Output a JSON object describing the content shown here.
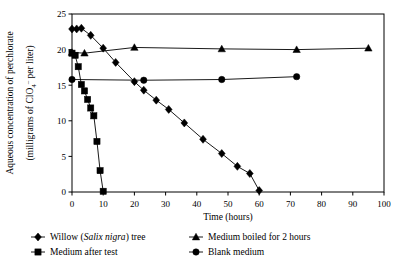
{
  "chart_data": {
    "type": "line",
    "title": "",
    "xlabel": "Time (hours)",
    "ylabel_line1": "Aqueous concentration of perchlorate",
    "ylabel_line2_prefix": "(milligrams of ClO",
    "ylabel_line2_sub": "4",
    "ylabel_line2_sup": "–",
    "ylabel_line2_suffix": " per liter)",
    "xlim": [
      0,
      100
    ],
    "ylim": [
      0,
      25
    ],
    "xticks": [
      0,
      10,
      20,
      30,
      40,
      50,
      60,
      70,
      80,
      90,
      100
    ],
    "yticks": [
      0,
      5,
      10,
      15,
      20,
      25
    ],
    "xtick_labels": [
      "0",
      "10",
      "20",
      "30",
      "40",
      "50",
      "60",
      "70",
      "80",
      "90",
      "100"
    ],
    "ytick_labels": [
      "0",
      "5",
      "10",
      "15",
      "20",
      "25"
    ],
    "grid": false,
    "legend_position": "below",
    "frame": "box",
    "series": [
      {
        "name": "Willow (Salix nigra) tree",
        "marker": "diamond",
        "color": "#000000",
        "x": [
          0,
          1.5,
          3,
          6,
          10,
          14,
          20,
          23,
          27,
          31,
          36,
          42,
          48,
          53,
          57,
          60
        ],
        "y": [
          22.9,
          22.9,
          23.0,
          22.0,
          20.2,
          18.2,
          15.5,
          14.3,
          12.9,
          11.6,
          9.7,
          7.4,
          5.4,
          3.6,
          2.6,
          0.2
        ]
      },
      {
        "name": "Medium boiled for 2 hours",
        "marker": "triangle",
        "color": "#000000",
        "x": [
          0,
          4,
          20,
          48,
          72,
          95
        ],
        "y": [
          19.6,
          19.5,
          20.3,
          20.1,
          20.0,
          20.2
        ]
      },
      {
        "name": "Medium after test",
        "marker": "square",
        "color": "#000000",
        "x": [
          0,
          1,
          2,
          3,
          4,
          5,
          6,
          7,
          8,
          9,
          10
        ],
        "y": [
          19.5,
          19.2,
          17.6,
          15.1,
          14.2,
          13.0,
          11.8,
          10.7,
          7.1,
          3.0,
          0.1
        ]
      },
      {
        "name": "Blank medium",
        "marker": "circle",
        "color": "#000000",
        "x": [
          0,
          23,
          48,
          72
        ],
        "y": [
          15.8,
          15.7,
          15.8,
          16.2
        ]
      }
    ],
    "legend": [
      {
        "label_pre": "Willow (",
        "label_italic": "Salix nigra",
        "label_post": ") tree",
        "marker": "diamond"
      },
      {
        "label_pre": "Medium boiled for 2 hours",
        "label_italic": "",
        "label_post": "",
        "marker": "triangle"
      },
      {
        "label_pre": "Medium after test",
        "label_italic": "",
        "label_post": "",
        "marker": "square"
      },
      {
        "label_pre": "Blank medium",
        "label_italic": "",
        "label_post": "",
        "marker": "circle"
      }
    ]
  }
}
